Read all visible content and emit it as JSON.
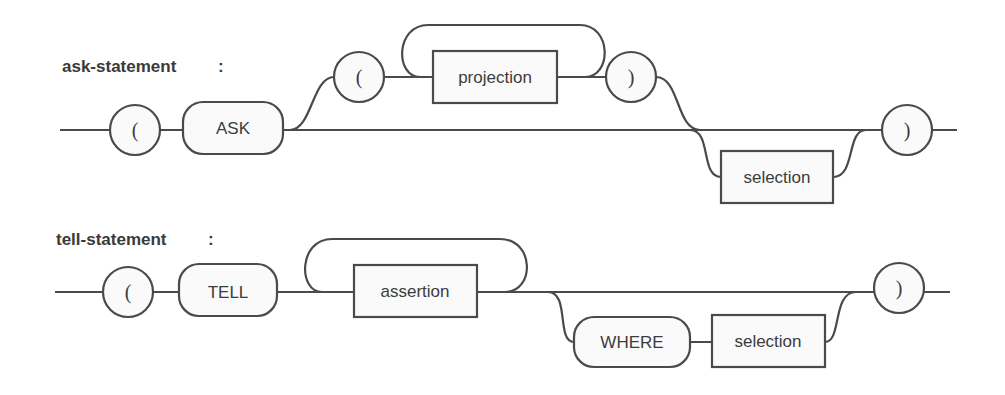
{
  "diagram": {
    "type": "syntax-railroad-diagram",
    "rules": [
      {
        "name": "ask-statement",
        "separator": ":",
        "elements": {
          "open_paren": "(",
          "keyword": "ASK",
          "optional_open_paren": "(",
          "repeated_nonterminal": "projection",
          "optional_close_paren": ")",
          "optional_nonterminal": "selection",
          "close_paren": ")"
        }
      },
      {
        "name": "tell-statement",
        "separator": ":",
        "elements": {
          "open_paren": "(",
          "keyword": "TELL",
          "repeated_nonterminal": "assertion",
          "optional_keyword": "WHERE",
          "optional_nonterminal": "selection",
          "close_paren": ")"
        }
      }
    ],
    "colors": {
      "stroke": "#4a4a4a",
      "fill": "#fafafa",
      "text": "#3c3c3c",
      "background": "#ffffff"
    }
  }
}
